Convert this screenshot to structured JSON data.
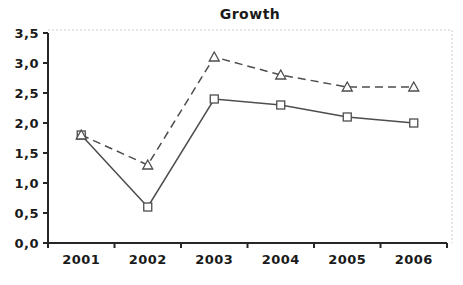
{
  "chart_data": {
    "type": "line",
    "title": "Growth",
    "categories": [
      "2001",
      "2002",
      "2003",
      "2004",
      "2005",
      "2006"
    ],
    "series": [
      {
        "name": "solid line with square markers",
        "values": [
          1.8,
          0.6,
          2.4,
          2.3,
          2.1,
          2.0
        ],
        "line_style": "solid",
        "marker": "square"
      },
      {
        "name": "dashed line with triangle markers",
        "values": [
          1.8,
          1.3,
          3.1,
          2.8,
          2.6,
          2.6
        ],
        "line_style": "dashed",
        "marker": "triangle"
      }
    ],
    "xlabel": "",
    "ylabel": "",
    "ylim": [
      0,
      3.5
    ],
    "y_tick_step": 0.5,
    "y_tick_labels": [
      "0,0",
      "0,5",
      "1,0",
      "1,5",
      "2,0",
      "2,5",
      "3,0",
      "3,5"
    ],
    "decimal_separator": ",",
    "grid": "off",
    "legend": "none",
    "colors": {
      "line": "#4d4d4d",
      "marker_fill": "#ffffff",
      "marker_stroke": "#4d4d4d",
      "axis": "#262626",
      "text": "#1a1a1a",
      "plot_border": "#cccccc",
      "background": "#ffffff"
    }
  }
}
